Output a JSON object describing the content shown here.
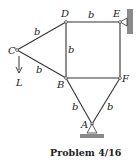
{
  "caption": "Problem 4/16",
  "nodes": {
    "A": "A",
    "B": "B",
    "C": "C",
    "D": "D",
    "E": "E",
    "F": "F"
  },
  "load_label": "L",
  "member_label": "b",
  "colors": {
    "line": "#333333",
    "support": "#8a8a8a"
  }
}
